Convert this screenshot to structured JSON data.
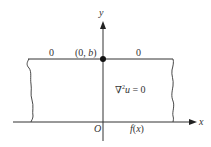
{
  "diagram": {
    "axes": {
      "x_label": "x",
      "y_label": "y",
      "origin_label": "O"
    },
    "top_boundary": {
      "left_value": "0",
      "right_value": "0",
      "point_label_prefix": "(0, ",
      "point_label_var": "b",
      "point_label_suffix": ")"
    },
    "bottom_boundary": {
      "function_label_f": "f",
      "function_label_open": "(",
      "function_label_var": "x",
      "function_label_close": ")"
    },
    "equation": {
      "nabla": "∇",
      "exponent": "2",
      "var": "u",
      "rest": " = 0"
    },
    "colors": {
      "line": "#333333",
      "background": "#ffffff"
    }
  }
}
